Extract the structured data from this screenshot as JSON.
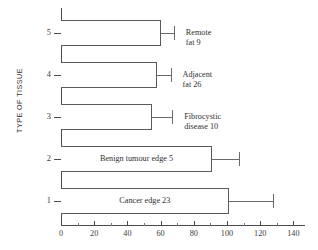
{
  "chart_data": {
    "type": "bar",
    "orientation": "horizontal",
    "title": "",
    "xlabel": "",
    "ylabel": "TYPE OF TISSUE",
    "xlim": [
      0,
      147
    ],
    "ylim": [
      0.4,
      5.6
    ],
    "grid": false,
    "legend": null,
    "xticks": [
      0,
      20,
      40,
      60,
      80,
      100,
      120,
      140
    ],
    "xticklabels": [
      "0",
      "20",
      "40",
      "60",
      "80",
      "100",
      "120",
      "140"
    ],
    "xminorticks": [
      10,
      30,
      50,
      70,
      90,
      110,
      130
    ],
    "yticks": [
      1,
      2,
      3,
      4,
      5
    ],
    "yticklabels": [
      "1",
      "2",
      "3",
      "4",
      "5"
    ],
    "categories": [
      "1",
      "2",
      "3",
      "4",
      "5"
    ],
    "values": [
      101,
      91,
      55,
      58,
      60
    ],
    "error_high": [
      128,
      107,
      67,
      66,
      68
    ],
    "annotations": [
      {
        "category": "5",
        "text": "Remote fat 9",
        "line1": "Remote",
        "line2": "fat 9",
        "placement": "outside"
      },
      {
        "category": "4",
        "text": "Adjacent fat 26",
        "line1": "Adjacent",
        "line2": "fat 26",
        "placement": "outside"
      },
      {
        "category": "3",
        "text": "Fibrocystic disease 10",
        "line1": "Fibrocystic",
        "line2": "disease 10",
        "placement": "outside"
      },
      {
        "category": "2",
        "text": "Benign tumour edge 5",
        "line1": "Benign tumour edge 5",
        "line2": "",
        "placement": "inside"
      },
      {
        "category": "1",
        "text": "Cancer edge 23",
        "line1": "Cancer edge 23",
        "line2": "",
        "placement": "inside"
      }
    ],
    "colors": {
      "bar_fill": "#ffffff",
      "bar_edge": "#5a5a5a",
      "axis": "#4a4a4a",
      "text": "#2f2f2f"
    }
  }
}
